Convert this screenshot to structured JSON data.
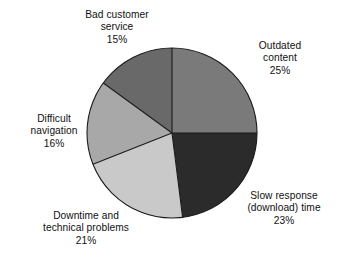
{
  "chart_data": {
    "type": "pie",
    "title": "",
    "subtitle": "",
    "xlabel": "",
    "ylabel": "",
    "legend_position": "none",
    "grid": false,
    "start_angle_deg": 0,
    "direction": "clockwise",
    "categories": [
      "Outdated content",
      "Slow response (download) time",
      "Downtime and technical problems",
      "Difficult navigation",
      "Bad customer service"
    ],
    "values": [
      25,
      23,
      21,
      16,
      15
    ],
    "value_unit": "%",
    "total": 100,
    "colors": [
      "#7a7a7a",
      "#2b2b2b",
      "#c9c9c9",
      "#a8a8a8",
      "#696969"
    ],
    "slices": [
      {
        "name": "outdated-content",
        "label_lines": [
          "Outdated",
          "content"
        ],
        "value": 25,
        "value_text": "25%",
        "color": "#7a7a7a",
        "start_deg": 0,
        "end_deg": 90
      },
      {
        "name": "slow-response-download-time",
        "label_lines": [
          "Slow response",
          "(download) time"
        ],
        "value": 23,
        "value_text": "23%",
        "color": "#2b2b2b",
        "start_deg": 90,
        "end_deg": 172.8
      },
      {
        "name": "downtime-and-technical-problems",
        "label_lines": [
          "Downtime and",
          "technical problems"
        ],
        "value": 21,
        "value_text": "21%",
        "color": "#c9c9c9",
        "start_deg": 172.8,
        "end_deg": 248.4
      },
      {
        "name": "difficult-navigation",
        "label_lines": [
          "Difficult",
          "navigation"
        ],
        "value": 16,
        "value_text": "16%",
        "color": "#a8a8a8",
        "start_deg": 248.4,
        "end_deg": 306
      },
      {
        "name": "bad-customer-service",
        "label_lines": [
          "Bad customer",
          "service"
        ],
        "value": 15,
        "value_text": "15%",
        "color": "#696969",
        "start_deg": 306,
        "end_deg": 360
      }
    ],
    "geometry": {
      "center_x": 172,
      "center_y": 133,
      "radius": 85,
      "separator_color": "#1a1a1a",
      "separator_width": 1.1,
      "background": "#ffffff"
    }
  },
  "labels": {
    "outdated_content": {
      "line1": "Outdated",
      "line2": "content",
      "pct": "25%"
    },
    "slow_response": {
      "line1": "Slow response",
      "line2": "(download) time",
      "pct": "23%"
    },
    "downtime": {
      "line1": "Downtime and",
      "line2": "technical problems",
      "pct": "21%"
    },
    "difficult_navigation": {
      "line1": "Difficult",
      "line2": "navigation",
      "pct": "16%"
    },
    "bad_customer_service": {
      "line1": "Bad customer",
      "line2": "service",
      "pct": "15%"
    }
  }
}
